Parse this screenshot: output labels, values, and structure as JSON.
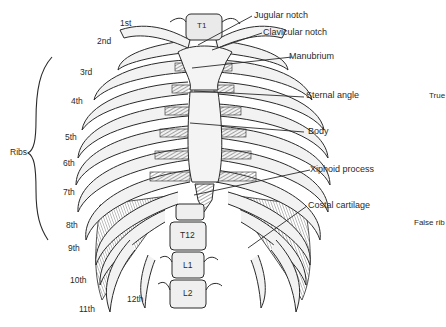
{
  "diagram": {
    "left_labels": {
      "ribs_group": "Ribs",
      "ribs": [
        "1st",
        "2nd",
        "3rd",
        "4th",
        "5th",
        "6th",
        "7th",
        "8th",
        "9th",
        "10th",
        "11th",
        "12th"
      ]
    },
    "right_labels": {
      "jugular_notch": "Jugular notch",
      "clavicular_notch": "Clavicular notch",
      "manubrium": "Manubrium",
      "sternal_angle": "Sternal angle",
      "body": "Body",
      "xiphoid_process": "Xiphoid process",
      "costal_cartilage": "Costal cartilage"
    },
    "far_right_labels": {
      "true_ribs": "True",
      "false_ribs": "False rib"
    },
    "vertebrae": [
      "T1",
      "T12",
      "L1",
      "L2"
    ],
    "colors": {
      "ink": "#2a2a2a",
      "bone": "#f2f2f2",
      "cartilage": "#9a9a9a",
      "background": "#ffffff"
    }
  }
}
